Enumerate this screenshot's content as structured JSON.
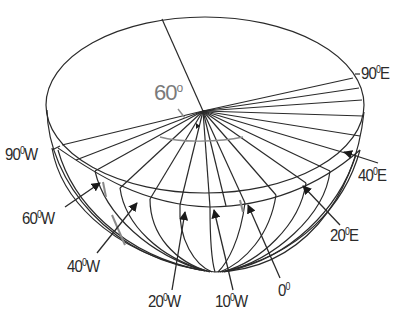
{
  "diagram": {
    "type": "hemisphere-longitude-projection",
    "angle_label": {
      "value": "60",
      "unit": "o"
    },
    "labels": [
      {
        "id": "90E",
        "value": "90",
        "deg": "0",
        "dir": "E"
      },
      {
        "id": "90W",
        "value": "90",
        "deg": "0",
        "dir": "W"
      },
      {
        "id": "40E",
        "value": "40",
        "deg": "0",
        "dir": "E"
      },
      {
        "id": "60W",
        "value": "60",
        "deg": "0",
        "dir": "W"
      },
      {
        "id": "20E",
        "value": "20",
        "deg": "0",
        "dir": "E"
      },
      {
        "id": "40W",
        "value": "40",
        "deg": "0",
        "dir": "W"
      },
      {
        "id": "20W",
        "value": "20",
        "deg": "0",
        "dir": "W"
      },
      {
        "id": "10W",
        "value": "10",
        "deg": "0",
        "dir": "W"
      },
      {
        "id": "0",
        "value": "0",
        "deg": "0",
        "dir": ""
      }
    ],
    "colors": {
      "line": "#2a2a2a",
      "accent_gray": "#8a8a8a",
      "background": "#ffffff"
    }
  }
}
